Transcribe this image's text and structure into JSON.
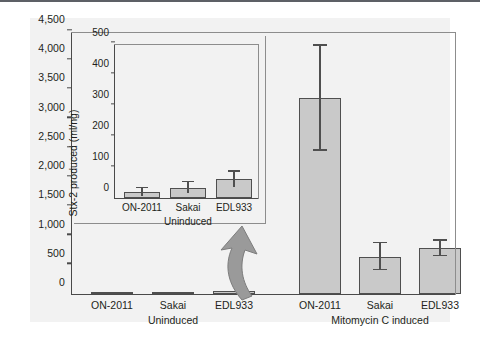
{
  "figure": {
    "background_color": "#f2f2f2",
    "bar_fill_color": "#c9c9c9",
    "bar_edge_color": "#4f4f4f",
    "axis_color": "#4a4a4a",
    "arrow_color": "#9a9a9a"
  },
  "chart_data": {
    "type": "bar",
    "title": "",
    "xlabel": "",
    "ylabel": "Stx-2 produced (ml/ng)",
    "ylim": [
      0,
      4500
    ],
    "yticks": [
      "0",
      "500",
      "1,000",
      "1,500",
      "2,000",
      "2,500",
      "3,000",
      "3,500",
      "4,000",
      "4,500"
    ],
    "ytick_values": [
      0,
      500,
      1000,
      1500,
      2000,
      2500,
      3000,
      3500,
      4000,
      4500
    ],
    "grid": false,
    "legend": "none",
    "categories": [
      "ON-2011",
      "Sakai",
      "EDL933",
      "ON-2011",
      "Sakai",
      "EDL933"
    ],
    "group_labels": [
      "Uninduced",
      "Mitomycin C induced"
    ],
    "values": [
      20,
      33,
      60,
      3350,
      640,
      780
    ],
    "err_upper": [
      12,
      18,
      25,
      900,
      230,
      130
    ],
    "err_lower": [
      12,
      18,
      25,
      900,
      230,
      130
    ],
    "bars": [
      {
        "category": "ON-2011",
        "group": "Uninduced",
        "value": 20,
        "err_upper": 12,
        "err_lower": 12
      },
      {
        "category": "Sakai",
        "group": "Uninduced",
        "value": 33,
        "err_upper": 18,
        "err_lower": 18
      },
      {
        "category": "EDL933",
        "group": "Uninduced",
        "value": 60,
        "err_upper": 25,
        "err_lower": 25
      },
      {
        "category": "ON-2011",
        "group": "Mitomycin C induced",
        "value": 3350,
        "err_upper": 900,
        "err_lower": 900
      },
      {
        "category": "Sakai",
        "group": "Mitomycin C induced",
        "value": 640,
        "err_upper": 230,
        "err_lower": 230
      },
      {
        "category": "EDL933",
        "group": "Mitomycin C induced",
        "value": 780,
        "err_upper": 130,
        "err_lower": 130
      }
    ]
  },
  "inset_chart_data": {
    "type": "bar",
    "title": "",
    "xlabel": "",
    "ylabel": "",
    "ylim": [
      0,
      500
    ],
    "yticks": [
      "0",
      "100",
      "200",
      "300",
      "400",
      "500"
    ],
    "ytick_values": [
      0,
      100,
      200,
      300,
      400,
      500
    ],
    "grid": false,
    "legend": "none",
    "categories": [
      "ON-2011",
      "Sakai",
      "EDL933"
    ],
    "group_labels": [
      "Uninduced"
    ],
    "values": [
      20,
      33,
      60
    ],
    "err_upper": [
      12,
      18,
      25
    ],
    "err_lower": [
      12,
      18,
      25
    ],
    "bars": [
      {
        "category": "ON-2011",
        "value": 20,
        "err_upper": 12,
        "err_lower": 12
      },
      {
        "category": "Sakai",
        "value": 33,
        "err_upper": 18,
        "err_lower": 18
      },
      {
        "category": "EDL933",
        "value": 60,
        "err_upper": 25,
        "err_lower": 25
      }
    ]
  },
  "annotations": {
    "arrow_name": "inset-callout-arrow",
    "arrow_from": "EDL933 Uninduced bar",
    "arrow_to": "inset chart"
  }
}
